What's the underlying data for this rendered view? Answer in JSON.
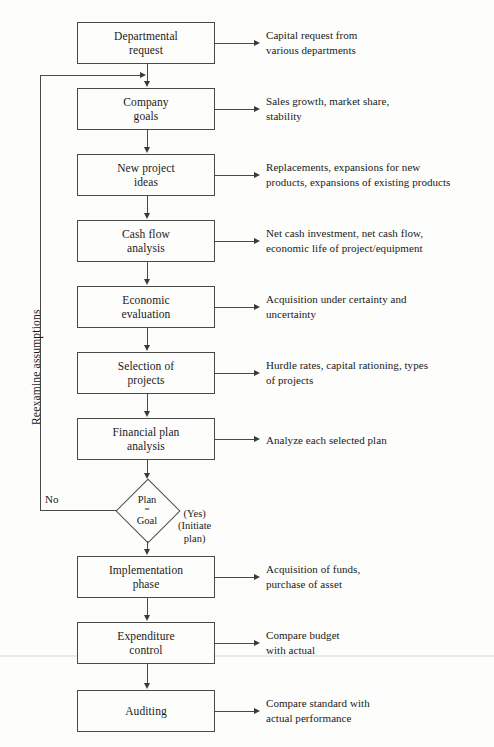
{
  "diagram": {
    "background_color": "#fdfdfb",
    "line_color": "#4a4a4a"
  },
  "nodes": [
    {
      "id": "departmental-request",
      "label": "Departmental\nrequest",
      "annotation": "Capital request from\nvarious departments"
    },
    {
      "id": "company-goals",
      "label": "Company\ngoals",
      "annotation": "Sales growth, market share,\nstability"
    },
    {
      "id": "new-project-ideas",
      "label": "New project\nideas",
      "annotation": "Replacements, expansions for new\nproducts, expansions of existing products"
    },
    {
      "id": "cash-flow-analysis",
      "label": "Cash flow\nanalysis",
      "annotation": "Net cash investment, net cash flow,\neconomic life of project/equipment"
    },
    {
      "id": "economic-evaluation",
      "label": "Economic\nevaluation",
      "annotation": "Acquisition under certainty and\nuncertainty"
    },
    {
      "id": "selection-of-projects",
      "label": "Selection of\nprojects",
      "annotation": "Hurdle rates, capital rationing, types\nof projects"
    },
    {
      "id": "financial-plan-analysis",
      "label": "Financial plan\nanalysis",
      "annotation": "Analyze each selected plan"
    },
    {
      "id": "implementation-phase",
      "label": "Implementation\nphase",
      "annotation": "Acquisition of funds,\npurchase of asset"
    },
    {
      "id": "expenditure-control",
      "label": "Expenditure\ncontrol",
      "annotation": "Compare budget\nwith actual"
    },
    {
      "id": "auditing",
      "label": "Auditing",
      "annotation": "Compare standard with\nactual performance"
    }
  ],
  "decision": {
    "id": "plan-equals-goal",
    "line1": "Plan",
    "operator": "=",
    "line2": "Goal"
  },
  "edges": {
    "no_label": "No",
    "yes_label": "(Yes)\n(Initiate\nplan)",
    "loop_caption": "Reexamine assumptions"
  }
}
